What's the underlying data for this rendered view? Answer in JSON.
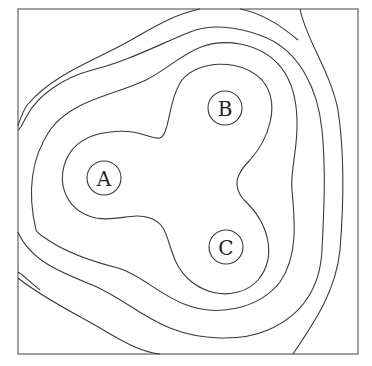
{
  "diagram": {
    "type": "equipotential-contour-map",
    "frame": {
      "x": 18,
      "y": 9,
      "width": 340,
      "height": 345
    },
    "charges": [
      {
        "id": "A",
        "label": "A",
        "cx": 104,
        "cy": 178,
        "r": 17
      },
      {
        "id": "B",
        "label": "B",
        "cx": 225,
        "cy": 108,
        "r": 17
      },
      {
        "id": "C",
        "label": "C",
        "cx": 226,
        "cy": 247,
        "r": 17
      }
    ],
    "contour_count": 5,
    "colors": {
      "line": "#3a3a3a",
      "frame": "#6e6e6e",
      "background": "#ffffff"
    }
  }
}
